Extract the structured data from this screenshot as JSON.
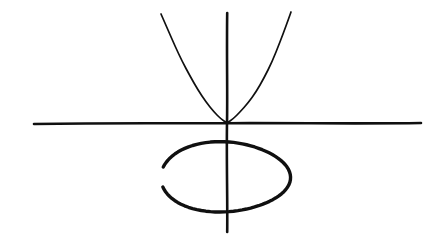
{
  "figure": {
    "kind": "hand-drawn-sketch",
    "background_color": "#ffffff",
    "ink_color": "#101010",
    "canvas": {
      "width": 442,
      "height": 251
    }
  },
  "chart_data": {
    "type": "line",
    "title": "",
    "xlabel": "",
    "ylabel": "",
    "grid": false,
    "legend": null,
    "axes": {
      "origin_px": {
        "x": 227,
        "y": 123
      },
      "x_axis": {
        "label": "",
        "start_px": {
          "x": 34,
          "y": 123
        },
        "end_px": {
          "x": 421,
          "y": 123
        },
        "stroke_width": 2.6,
        "color": "#101010",
        "ticks": [],
        "tick_labels": []
      },
      "y_axis": {
        "label": "",
        "start_px": {
          "x": 227,
          "y": 13
        },
        "end_px": {
          "x": 227,
          "y": 232
        },
        "stroke_width": 2.6,
        "color": "#101010",
        "ticks": [],
        "tick_labels": []
      }
    },
    "series": [
      {
        "name": "parabola",
        "type": "curve",
        "shape": "upward-opening parabola with vertex tangent to the x-axis at the origin",
        "closed": false,
        "color": "#101010",
        "stroke_width": 1.7,
        "vertex_px": {
          "x": 227,
          "y": 123
        },
        "left_endpoint_px": {
          "x": 161,
          "y": 14
        },
        "right_endpoint_px": {
          "x": 291,
          "y": 12
        },
        "points_px": [
          [
            161,
            14
          ],
          [
            168,
            30
          ],
          [
            175,
            46
          ],
          [
            182,
            61
          ],
          [
            190,
            76
          ],
          [
            198,
            90
          ],
          [
            206,
            102
          ],
          [
            214,
            112
          ],
          [
            221,
            119
          ],
          [
            227,
            123
          ],
          [
            233,
            119
          ],
          [
            240,
            112
          ],
          [
            248,
            103
          ],
          [
            256,
            92
          ],
          [
            264,
            78
          ],
          [
            272,
            62
          ],
          [
            280,
            42
          ],
          [
            286,
            26
          ],
          [
            291,
            12
          ]
        ]
      },
      {
        "name": "ellipse",
        "type": "curve",
        "shape": "ellipse below the x-axis, drawn with a visible gap on the left side",
        "closed": false,
        "color": "#101010",
        "stroke_width": 3.4,
        "center_px": {
          "x": 224,
          "y": 177
        },
        "radius_x_px": 65,
        "radius_y_px": 35,
        "gap": {
          "present": true,
          "side": "left",
          "start_angle_deg": 163,
          "end_angle_deg": 197
        }
      }
    ]
  }
}
